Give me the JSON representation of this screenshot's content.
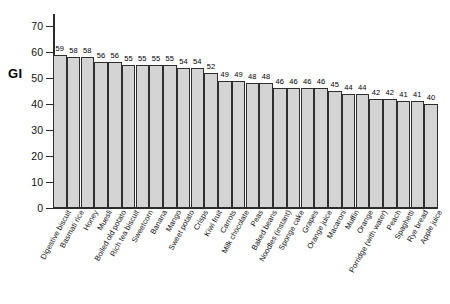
{
  "chart_data": {
    "type": "bar",
    "title": "",
    "xlabel": "",
    "ylabel": "GI",
    "ylim": [
      0,
      70
    ],
    "yticks": [
      0,
      10,
      20,
      30,
      40,
      50,
      60,
      70
    ],
    "grid": false,
    "legend": "none",
    "bar_color": "#d4d4d4",
    "bar_edge_color": "#2e2e2e",
    "show_value_labels": true,
    "categories": [
      "Digestive biscuit",
      "Basmati rice",
      "Honey",
      "Muesli",
      "Boiled old potato",
      "Rich tea biscuit",
      "Sweetcorn",
      "Banana",
      "Mango",
      "Sweet potato",
      "Crisps",
      "Kiwi fruit",
      "Carrots",
      "Milk chocolate",
      "Peas",
      "Baked beans",
      "Noodles (instant)",
      "Sponge cake",
      "Grapes",
      "Orange juice",
      "Macaroni",
      "Muffin",
      "Orange",
      "Porridge (with water)",
      "Peach",
      "Spaghetti",
      "Rye bread",
      "Apple juice"
    ],
    "values": [
      59,
      58,
      58,
      56,
      56,
      55,
      55,
      55,
      55,
      54,
      54,
      52,
      49,
      49,
      48,
      48,
      46,
      46,
      46,
      46,
      45,
      44,
      44,
      42,
      42,
      41,
      41,
      40
    ]
  }
}
